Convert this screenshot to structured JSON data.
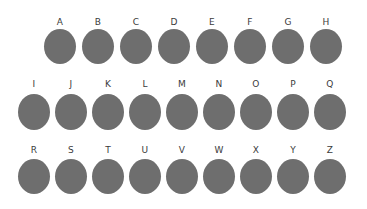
{
  "canvas": {
    "width": 367,
    "height": 209,
    "background_color": "#ffffff"
  },
  "style": {
    "shape_fill_color": "#6e6e6e",
    "label_text_color": "#3b3b3b",
    "shape_type": "ellipse"
  },
  "grid": {
    "rows": [
      {
        "row_index": 1,
        "count": 8,
        "cells": [
          {
            "label": "A"
          },
          {
            "label": "B"
          },
          {
            "label": "C"
          },
          {
            "label": "D"
          },
          {
            "label": "E"
          },
          {
            "label": "F"
          },
          {
            "label": "G"
          },
          {
            "label": "H"
          }
        ]
      },
      {
        "row_index": 2,
        "count": 9,
        "cells": [
          {
            "label": "I"
          },
          {
            "label": "J"
          },
          {
            "label": "K"
          },
          {
            "label": "L"
          },
          {
            "label": "M"
          },
          {
            "label": "N"
          },
          {
            "label": "O"
          },
          {
            "label": "P"
          },
          {
            "label": "Q"
          }
        ]
      },
      {
        "row_index": 3,
        "count": 9,
        "cells": [
          {
            "label": "R"
          },
          {
            "label": "S"
          },
          {
            "label": "T"
          },
          {
            "label": "U"
          },
          {
            "label": "V"
          },
          {
            "label": "W"
          },
          {
            "label": "X"
          },
          {
            "label": "Y"
          },
          {
            "label": "Z"
          }
        ]
      }
    ]
  }
}
